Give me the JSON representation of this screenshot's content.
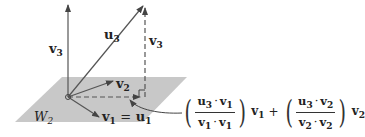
{
  "diagram": {
    "plane": {
      "label": "W",
      "label_sub": "2",
      "color": "#c8c8c8"
    },
    "vectors": {
      "v3_left": {
        "label": "v",
        "sub": "3"
      },
      "u3": {
        "label": "u",
        "sub": "3"
      },
      "v3_right": {
        "label": "v",
        "sub": "3"
      },
      "v2": {
        "label": "v",
        "sub": "2"
      },
      "v1": {
        "label": "v",
        "sub": "1",
        "eq": "=",
        "label2": "u",
        "sub2": "1"
      }
    },
    "formula": {
      "term1": {
        "num_a": "u",
        "num_a_sub": "3",
        "dot": "·",
        "num_b": "v",
        "num_b_sub": "1",
        "den_a": "v",
        "den_a_sub": "1",
        "den_b": "v",
        "den_b_sub": "1",
        "vec": "v",
        "vec_sub": "1"
      },
      "plus": "+",
      "term2": {
        "num_a": "u",
        "num_a_sub": "3",
        "dot": "·",
        "num_b": "v",
        "num_b_sub": "2",
        "den_a": "v",
        "den_a_sub": "2",
        "den_b": "v",
        "den_b_sub": "2",
        "vec": "v",
        "vec_sub": "2"
      }
    },
    "colors": {
      "line": "#555555",
      "plane": "#c8c8c8",
      "text": "#222222"
    }
  }
}
